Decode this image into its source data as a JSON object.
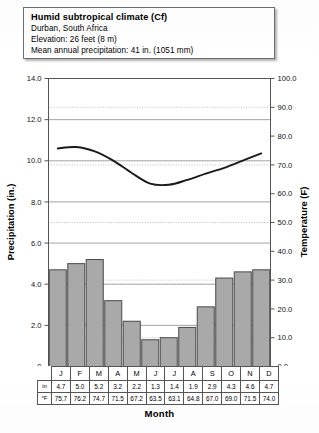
{
  "header": {
    "title": "Humid subtropical climate (Cf)",
    "location": "Durban, South Africa",
    "elevation": "Elevation: 26 feet (8 m)",
    "precipitation": "Mean annual precipitation: 41 in. (1051 mm)"
  },
  "axes": {
    "left_title": "Precipitation (in.)",
    "right_title": "Temperature (F)",
    "x_title": "Month",
    "left_ticks": [
      "14.0",
      "12.0",
      "10.0",
      "8.0",
      "6.0",
      "4.0",
      "2.0",
      "0"
    ],
    "right_ticks": [
      "100.0",
      "90.0",
      "80.0",
      "70.0",
      "60.0",
      "50.0",
      "40.0",
      "30.0",
      "20.0",
      "10.0",
      "0.0"
    ]
  },
  "table": {
    "row_head_precip": "in",
    "row_head_temp": "°F",
    "months": [
      "J",
      "F",
      "M",
      "A",
      "M",
      "J",
      "J",
      "A",
      "S",
      "O",
      "N",
      "D"
    ],
    "precip": [
      "4.7",
      "5.0",
      "5.2",
      "3.2",
      "2.2",
      "1.3",
      "1.4",
      "1.9",
      "2.9",
      "4.3",
      "4.6",
      "4.7"
    ],
    "temp": [
      "75.7",
      "76.2",
      "74.7",
      "71.5",
      "67.2",
      "63.5",
      "63.1",
      "64.8",
      "67.0",
      "69.0",
      "71.5",
      "74.0"
    ]
  },
  "colors": {
    "bar_fill": "#a9a9a9",
    "bar_stroke": "#4a4a4a",
    "line": "#1a1a1a",
    "grid_solid": "#9a9a9a",
    "grid_dotted": "#b0b0b0",
    "frame": "#555555"
  },
  "chart_data": {
    "type": "bar",
    "xlabel": "Month",
    "ylabel": "Precipitation (in.)",
    "y2label": "Temperature (F)",
    "categories": [
      "J",
      "F",
      "M",
      "A",
      "M",
      "J",
      "J",
      "A",
      "S",
      "O",
      "N",
      "D"
    ],
    "ylim": [
      0,
      14
    ],
    "y2lim": [
      0,
      100
    ],
    "grid": true,
    "legend": "none",
    "series": [
      {
        "name": "Precipitation (in.)",
        "type": "bar",
        "axis": "left",
        "values": [
          4.7,
          5.0,
          5.2,
          3.2,
          2.2,
          1.3,
          1.4,
          1.9,
          2.9,
          4.3,
          4.6,
          4.7
        ]
      },
      {
        "name": "Temperature (F)",
        "type": "line",
        "axis": "right",
        "values": [
          75.7,
          76.2,
          74.7,
          71.5,
          67.2,
          63.5,
          63.1,
          64.8,
          67.0,
          69.0,
          71.5,
          74.0
        ]
      }
    ]
  }
}
